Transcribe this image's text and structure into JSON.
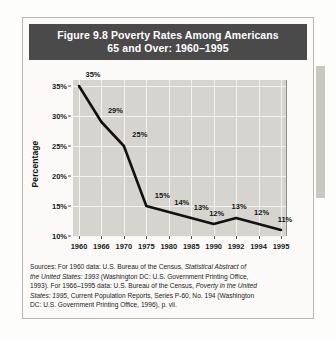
{
  "figure": {
    "title_line_1": "Figure 9.8  Poverty Rates Among Americans",
    "title_line_2": "65 and Over: 1960–1995",
    "banner_color": "#4a4a4a",
    "plot_background": "#d6d4cf",
    "line_color": "#111111",
    "gridline_color": "#f4f3f0"
  },
  "sources": {
    "line_1_a": "Sources: For 1960 data: U.S. Bureau of the Census, ",
    "line_1_i": "Statistical Abstract of",
    "line_2_i": "the United States: 1993",
    "line_2_a": " (Washington DC: U.S. Government Printing Office,",
    "line_3_a": "1993). For 1966–1995 data: U.S. Bureau of the Census, ",
    "line_3_i": "Poverty in the United",
    "line_4_i": "States: 1995",
    "line_4_a": ", Current Population Reports, Series P-60, No. 194 (Washington",
    "line_5_a": "DC: U.S. Government Printing Office, 1996), p. vii."
  },
  "chart_data": {
    "type": "line",
    "title": "Figure 9.8  Poverty Rates Among Americans 65 and Over: 1960–1995",
    "xlabel": "",
    "ylabel": "Percentage",
    "categories": [
      "1960",
      "1966",
      "1970",
      "1975",
      "1980",
      "1985",
      "1990",
      "1992",
      "1994",
      "1995"
    ],
    "values": [
      35,
      29,
      25,
      15,
      14,
      13,
      12,
      13,
      12,
      11
    ],
    "point_labels": [
      "35%",
      "29%",
      "25%",
      "15%",
      "14%",
      "13%",
      "12%",
      "13%",
      "12%",
      "11%"
    ],
    "ylim": [
      10,
      36
    ],
    "y_ticks": [
      10,
      15,
      20,
      25,
      30,
      35
    ],
    "y_tick_labels": [
      "10%",
      "15%",
      "20%",
      "25%",
      "30%",
      "35%"
    ],
    "grid": true,
    "legend": "none",
    "series": [
      {
        "name": "Poverty rate, Americans 65 and over",
        "values": [
          35,
          29,
          25,
          15,
          14,
          13,
          12,
          13,
          12,
          11
        ]
      }
    ]
  }
}
